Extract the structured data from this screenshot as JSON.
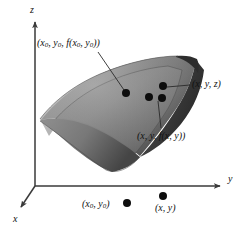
{
  "figure": {
    "background": "#ffffff",
    "width": 242,
    "height": 236
  },
  "axes": {
    "origin": {
      "x": 35,
      "y": 186
    },
    "items": [
      {
        "name": "z-axis",
        "label": "z",
        "direction": "up",
        "label_x": 30,
        "label_y": 5,
        "from": {
          "x": 35,
          "y": 186
        },
        "to": {
          "x": 35,
          "y": 20
        }
      },
      {
        "name": "y-axis",
        "label": "y",
        "direction": "right",
        "label_x": 228,
        "label_y": 174,
        "from": {
          "x": 35,
          "y": 186
        },
        "to": {
          "x": 222,
          "y": 186
        }
      },
      {
        "name": "x-axis",
        "label": "x",
        "direction": "down-left",
        "label_x": 13,
        "label_y": 216,
        "from": {
          "x": 35,
          "y": 186
        },
        "to": {
          "x": 20,
          "y": 208
        }
      }
    ],
    "color": "#3a3a3a"
  },
  "surface": {
    "name": "saddle-surface",
    "fill_light": "#b9b9b9",
    "fill_mid": "#8d8d8d",
    "fill_dark": "#4e4e4e",
    "edge_color": "#2f2f2f",
    "description": "curved saddle-shaped graph sheet of z = f(x, y) with inset rim"
  },
  "labels": [
    {
      "name": "label-point-x0y0-f",
      "text": "(x₀, y₀, f(x₀, y₀))",
      "html": "(<i>x</i><sub>0</sub>, <i>y</i><sub>0</sub>, <i>f</i>(<i>x</i><sub>0</sub>, <i>y</i><sub>0</sub>))",
      "x": 37,
      "y": 38,
      "leader": {
        "from": {
          "x": 98,
          "y": 52
        },
        "to": {
          "x": 124,
          "y": 90
        }
      }
    },
    {
      "name": "label-point-xyz",
      "text": "(x, y, z)",
      "html": "(<i>x</i>, <i>y</i>, <i>z</i>)",
      "x": 192,
      "y": 79,
      "leader": {
        "from": {
          "x": 190,
          "y": 85
        },
        "to": {
          "x": 166,
          "y": 88
        }
      }
    },
    {
      "name": "label-point-xy-f",
      "text": "(x, y, f(x, y))",
      "html": "(<i>x</i>, <i>y</i>, <i>f</i>(<i>x</i>, <i>y</i>))",
      "x": 137,
      "y": 131,
      "leader": {
        "from": {
          "x": 162,
          "y": 127
        },
        "to": {
          "x": 158,
          "y": 101
        }
      }
    },
    {
      "name": "label-domain-point-x0y0",
      "text": "(x₀, y₀)",
      "html": "(<i>x</i><sub>0</sub>, <i>y</i><sub>0</sub>)",
      "x": 82,
      "y": 199,
      "leader": null
    },
    {
      "name": "label-domain-point-xy",
      "text": "(x, y)",
      "html": "(<i>x</i>, <i>y</i>)",
      "x": 155,
      "y": 203,
      "leader": null
    }
  ],
  "points": [
    {
      "name": "point-on-surface-x0y0",
      "x": 126,
      "y": 93,
      "r": 4.0
    },
    {
      "name": "point-on-surface-xyz",
      "x": 163,
      "y": 86,
      "r": 4.0
    },
    {
      "name": "point-on-surface-xy-f",
      "x": 162,
      "y": 98,
      "r": 4.0
    },
    {
      "name": "point-on-surface-extra",
      "x": 149,
      "y": 97,
      "r": 4.0
    },
    {
      "name": "point-domain-x0y0",
      "x": 127,
      "y": 203,
      "r": 4.0
    },
    {
      "name": "point-domain-xy",
      "x": 163,
      "y": 196,
      "r": 4.0
    }
  ],
  "colors": {
    "ink": "#111111",
    "axis": "#3a3a3a",
    "leader": "#2a2a2a",
    "dot": "#0d0d0d"
  }
}
